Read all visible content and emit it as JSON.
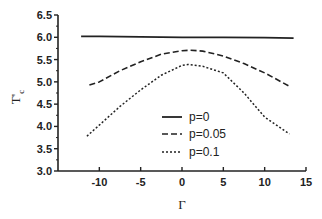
{
  "chart_data": {
    "type": "line",
    "title": "",
    "xlabel": "Γ",
    "ylabel": "T'c",
    "xlim": [
      -15,
      15
    ],
    "ylim": [
      3.0,
      6.5
    ],
    "xticks": [
      -10,
      -5,
      0,
      5,
      10,
      15
    ],
    "xtick_labels": [
      "-10",
      "-5",
      "0",
      "5",
      "10",
      "15"
    ],
    "yticks": [
      3.0,
      3.5,
      4.0,
      4.5,
      5.0,
      5.5,
      6.0,
      6.5
    ],
    "ytick_labels": [
      "3.0",
      "3.5",
      "4.0",
      "4.5",
      "5.0",
      "5.5",
      "6.0",
      "6.5"
    ],
    "grid": false,
    "legend_position": "lower center (inside plot)",
    "series": [
      {
        "name": "p=0",
        "style": "solid",
        "x": [
          -12.2,
          -10,
          -5,
          0,
          5,
          10,
          13.5
        ],
        "y": [
          6.02,
          6.02,
          6.01,
          6.0,
          6.0,
          5.99,
          5.98
        ]
      },
      {
        "name": "p=0.05",
        "style": "dashed",
        "x": [
          -11.2,
          -10,
          -7.5,
          -5,
          -2.5,
          0,
          1,
          2.5,
          5,
          7.5,
          10,
          13
        ],
        "y": [
          4.93,
          5.0,
          5.25,
          5.45,
          5.62,
          5.7,
          5.71,
          5.69,
          5.58,
          5.41,
          5.2,
          4.9
        ]
      },
      {
        "name": "p=0.1",
        "style": "dotted",
        "x": [
          -11.5,
          -10,
          -7.5,
          -5,
          -2.5,
          0,
          0.7,
          2.5,
          5,
          7.5,
          10,
          13
        ],
        "y": [
          3.78,
          4.03,
          4.45,
          4.82,
          5.15,
          5.37,
          5.39,
          5.35,
          5.2,
          4.75,
          4.21,
          3.83
        ]
      }
    ]
  }
}
